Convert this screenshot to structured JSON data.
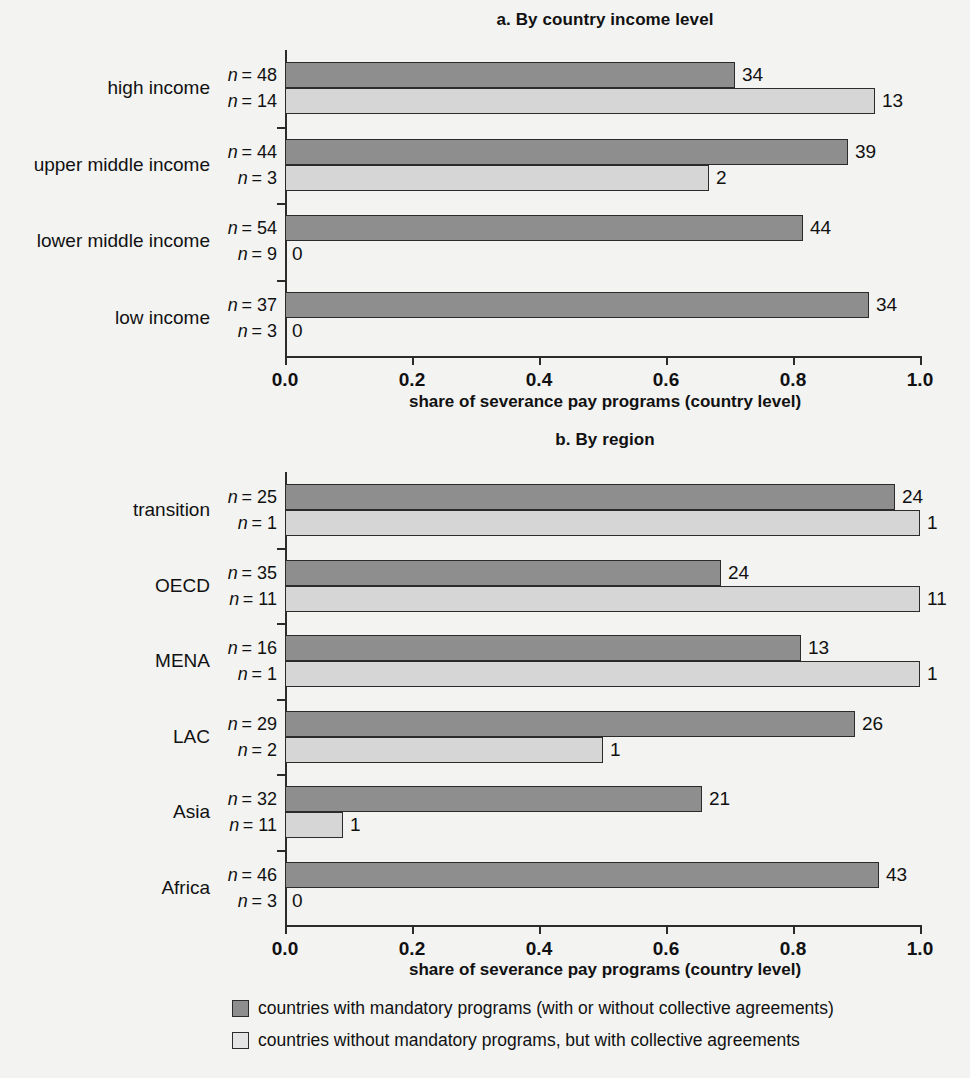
{
  "chart_data": [
    {
      "type": "bar",
      "orientation": "horizontal",
      "title": "a. By country income level",
      "xlabel": "share of severance pay programs (country level)",
      "ylabel": "",
      "xlim": [
        0.0,
        1.0
      ],
      "xticks": [
        "0.0",
        "0.2",
        "0.4",
        "0.6",
        "0.8",
        "1.0"
      ],
      "grid": false,
      "legend_position": "bottom",
      "categories": [
        "high income",
        "upper middle income",
        "lower middle income",
        "low income"
      ],
      "series": [
        {
          "name": "countries with mandatory programs (with or without collective agreements)",
          "color": "#8e8e8e",
          "counts": [
            34,
            39,
            44,
            34
          ],
          "n": [
            48,
            44,
            54,
            37
          ],
          "values": [
            0.708,
            0.886,
            0.815,
            0.919
          ],
          "labels": [
            "34",
            "39",
            "44",
            "34"
          ],
          "n_labels": [
            "n = 48",
            "n = 44",
            "n = 54",
            "n = 37"
          ]
        },
        {
          "name": "countries without mandatory programs, but with collective agreements",
          "color": "#d6d6d6",
          "counts": [
            13,
            2,
            0,
            0
          ],
          "n": [
            14,
            3,
            9,
            3
          ],
          "values": [
            0.929,
            0.667,
            0.0,
            0.0
          ],
          "labels": [
            "13",
            "2",
            "0",
            "0"
          ],
          "n_labels": [
            "n = 14",
            "n = 3",
            "n = 9",
            "n = 3"
          ]
        }
      ]
    },
    {
      "type": "bar",
      "orientation": "horizontal",
      "title": "b. By region",
      "xlabel": "share of severance pay programs (country level)",
      "ylabel": "",
      "xlim": [
        0.0,
        1.0
      ],
      "xticks": [
        "0.0",
        "0.2",
        "0.4",
        "0.6",
        "0.8",
        "1.0"
      ],
      "grid": false,
      "legend_position": "bottom",
      "categories": [
        "transition",
        "OECD",
        "MENA",
        "LAC",
        "Asia",
        "Africa"
      ],
      "series": [
        {
          "name": "countries with mandatory programs (with or without collective agreements)",
          "color": "#8e8e8e",
          "counts": [
            24,
            24,
            13,
            26,
            21,
            43
          ],
          "n": [
            25,
            35,
            16,
            29,
            32,
            46
          ],
          "values": [
            0.96,
            0.686,
            0.813,
            0.897,
            0.656,
            0.935
          ],
          "labels": [
            "24",
            "24",
            "13",
            "26",
            "21",
            "43"
          ],
          "n_labels": [
            "n = 25",
            "n = 35",
            "n = 16",
            "n = 29",
            "n = 32",
            "n = 46"
          ]
        },
        {
          "name": "countries without mandatory programs, but with collective agreements",
          "color": "#d6d6d6",
          "counts": [
            1,
            11,
            1,
            1,
            1,
            0
          ],
          "n": [
            1,
            11,
            1,
            2,
            11,
            3
          ],
          "values": [
            1.0,
            1.0,
            1.0,
            0.5,
            0.091,
            0.0
          ],
          "labels": [
            "1",
            "11",
            "1",
            "1",
            "1",
            "0"
          ],
          "n_labels": [
            "n = 1",
            "n = 11",
            "n = 1",
            "n = 2",
            "n = 11",
            "n = 3"
          ]
        }
      ]
    }
  ],
  "legend": {
    "items": [
      {
        "swatch": "dark",
        "color": "#8e8e8e",
        "label": "countries with mandatory programs (with or without collective agreements)"
      },
      {
        "swatch": "light",
        "color": "#e4e4e4",
        "label": "countries without mandatory programs, but with collective agreements"
      }
    ]
  },
  "colors": {
    "background": "#f3f3f2",
    "axis": "#2b2b2b",
    "text": "#111111",
    "series_mandatory": "#8e8e8e",
    "series_collective": "#d6d6d6"
  }
}
